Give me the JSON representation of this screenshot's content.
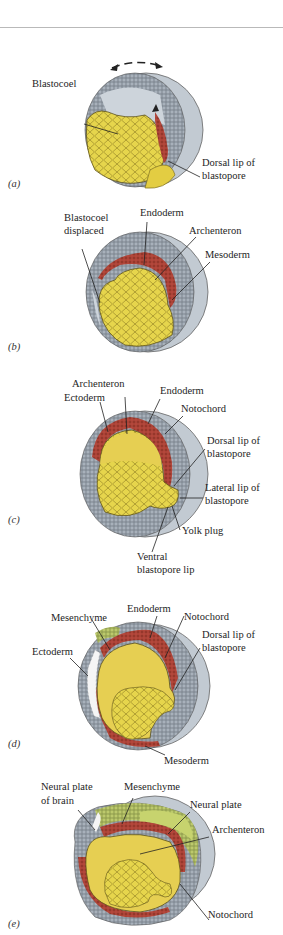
{
  "figure": {
    "colors": {
      "yolk": "#e8d64a",
      "yolk_cell_line": "#8a7a20",
      "ectoderm": "#a9b3bd",
      "surface": "#c4ccd4",
      "endoderm_mesoderm": "#b5453a",
      "neural_plate": "#b9c86a",
      "blastocoel": "#cfd6dc"
    },
    "panels": [
      {
        "tag": "(a)",
        "labels": [
          "Blastocoel",
          "Dorsal lip of",
          "blastopore"
        ]
      },
      {
        "tag": "(b)",
        "labels": [
          "Blastocoel",
          "displaced",
          "Endoderm",
          "Archenteron",
          "Mesoderm"
        ]
      },
      {
        "tag": "(c)",
        "labels": [
          "Archenteron",
          "Ectoderm",
          "Endoderm",
          "Notochord",
          "Dorsal lip of",
          "blastopore",
          "Lateral lip of",
          "blastopore",
          "Yolk plug",
          "Ventral",
          "blastopore lip"
        ]
      },
      {
        "tag": "(d)",
        "labels": [
          "Endoderm",
          "Mesenchyme",
          "Notochord",
          "Dorsal lip of",
          "blastopore",
          "Ectoderm",
          "Mesoderm"
        ]
      },
      {
        "tag": "(e)",
        "labels": [
          "Neural plate",
          "of brain",
          "Mesenchyme",
          "Neural plate",
          "Archenteron",
          "Notochord"
        ]
      }
    ]
  }
}
